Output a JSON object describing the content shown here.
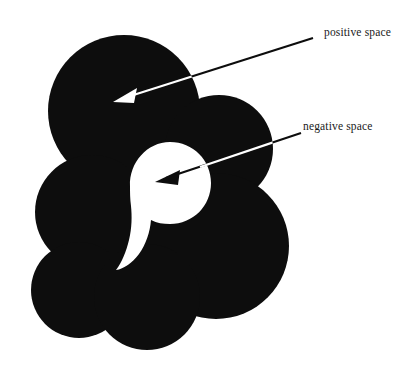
{
  "figure": {
    "background_color": "#ffffff",
    "ink_color": "#0d0d0d",
    "void_color": "#ffffff",
    "width": 415,
    "height": 387
  },
  "annotations": [
    {
      "id": "positive-space",
      "label": "positive space",
      "points_at": "black-mass",
      "arrow_start": {
        "x": 313,
        "y": 38
      },
      "arrow_end": {
        "x": 116,
        "y": 101
      },
      "label_x": 324,
      "label_y": 26
    },
    {
      "id": "negative-space",
      "label": "negative space",
      "points_at": "white-void",
      "arrow_start": {
        "x": 301,
        "y": 133
      },
      "arrow_end": {
        "x": 158,
        "y": 181
      },
      "label_x": 303,
      "label_y": 120
    }
  ],
  "shapes": {
    "positive_circles": [
      {
        "name": "top-left-large",
        "cx": 124,
        "cy": 111,
        "r": 76
      },
      {
        "name": "upper-right",
        "cx": 219,
        "cy": 149,
        "r": 54
      },
      {
        "name": "mid-left",
        "cx": 92,
        "cy": 212,
        "r": 57
      },
      {
        "name": "right-large",
        "cx": 216,
        "cy": 246,
        "r": 73
      },
      {
        "name": "bottom-left",
        "cx": 79,
        "cy": 290,
        "r": 48
      },
      {
        "name": "bottom-center",
        "cx": 147,
        "cy": 297,
        "r": 53
      }
    ],
    "negative_shape": {
      "name": "negative-space-void",
      "head_cx": 170,
      "head_cy": 183,
      "head_r": 41,
      "tail_tip_x": 116,
      "tail_tip_y": 268
    }
  },
  "caption": ""
}
